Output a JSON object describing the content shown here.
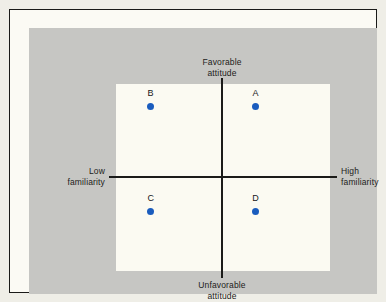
{
  "figure": {
    "background_color": "#c6c6c3",
    "plot_background_color": "#fbfaf2",
    "axis_color": "#1b1b19",
    "point_color": "#1a5cbe"
  },
  "axes": {
    "top": {
      "line1": "Favorable",
      "line2": "attitude"
    },
    "bottom": {
      "line1": "Unfavorable",
      "line2": "attitude"
    },
    "left": {
      "line1": "Low",
      "line2": "familiarity"
    },
    "right": {
      "line1": "High",
      "line2": "familiarity"
    }
  },
  "chart_data": {
    "type": "scatter",
    "title": "",
    "xlabel": "Familiarity",
    "ylabel": "Attitude",
    "xlim": [
      -1,
      1
    ],
    "ylim": [
      -1,
      1
    ],
    "grid": false,
    "legend": "none",
    "quadrant_axes": true,
    "axis_tick_labels": {
      "x_low": "Low familiarity",
      "x_high": "High familiarity",
      "y_high": "Favorable attitude",
      "y_low": "Unfavorable attitude"
    },
    "points": [
      {
        "label": "A",
        "x": 0.5,
        "y": 0.55,
        "quadrant": "high-familiarity-favorable"
      },
      {
        "label": "B",
        "x": -0.48,
        "y": 0.55,
        "quadrant": "low-familiarity-favorable"
      },
      {
        "label": "C",
        "x": -0.48,
        "y": -0.58,
        "quadrant": "low-familiarity-unfavorable"
      },
      {
        "label": "D",
        "x": 0.5,
        "y": -0.58,
        "quadrant": "high-familiarity-unfavorable"
      }
    ]
  }
}
